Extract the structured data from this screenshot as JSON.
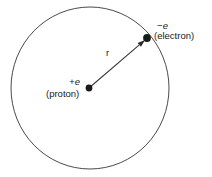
{
  "figure": {
    "type": "diagram",
    "background_color": "#ffffff",
    "stroke_color": "#4a4a4a",
    "dot_color": "#1a1a1a",
    "text_color": "#1a1a1a"
  },
  "orbit": {
    "name": "electron-orbit-circle",
    "center_x": 90,
    "center_y": 88,
    "radius_x": 79,
    "radius_y": 81
  },
  "proton": {
    "charge_sign": "+",
    "charge_symbol": "e",
    "charge_label": "+e",
    "name_label": "(proton)",
    "x": 89,
    "y": 88
  },
  "electron": {
    "charge_sign": "−",
    "charge_symbol": "e",
    "charge_label": "−e",
    "name_label": "(electron)",
    "x": 147,
    "y": 38
  },
  "radius_arrow": {
    "label": "r",
    "from_x": 89,
    "from_y": 88,
    "to_x": 145,
    "to_y": 40
  }
}
